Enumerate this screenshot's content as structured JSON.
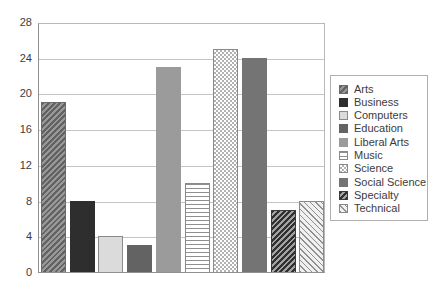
{
  "chart_data": {
    "type": "bar",
    "title": "",
    "xlabel": "",
    "ylabel": "",
    "categories": [
      "Arts",
      "Business",
      "Computers",
      "Education",
      "Liberal Arts",
      "Music",
      "Science",
      "Social Science",
      "Specialty",
      "Technical"
    ],
    "values": [
      19,
      8,
      4,
      3,
      23,
      10,
      25,
      24,
      7,
      8
    ],
    "ylim": [
      0,
      28
    ],
    "yticks": [
      0,
      4,
      8,
      12,
      16,
      20,
      24,
      28
    ],
    "grid": true,
    "legend_position": "right",
    "series_patterns": [
      {
        "name": "Arts",
        "pattern": "dark-diagonal-hatch",
        "colors": [
          "#626262",
          "#989898"
        ]
      },
      {
        "name": "Business",
        "pattern": "solid",
        "colors": [
          "#2e2e2e"
        ]
      },
      {
        "name": "Computers",
        "pattern": "solid",
        "colors": [
          "#dbdbdb"
        ]
      },
      {
        "name": "Education",
        "pattern": "solid",
        "colors": [
          "#636363"
        ]
      },
      {
        "name": "Liberal Arts",
        "pattern": "solid",
        "colors": [
          "#9b9b9b"
        ]
      },
      {
        "name": "Music",
        "pattern": "horizontal-lines",
        "colors": [
          "#8f8f8f",
          "#ffffff"
        ]
      },
      {
        "name": "Science",
        "pattern": "checkerboard",
        "colors": [
          "#b2b2b2",
          "#ffffff"
        ]
      },
      {
        "name": "Social Science",
        "pattern": "solid",
        "colors": [
          "#747474"
        ]
      },
      {
        "name": "Specialty",
        "pattern": "dense-dark-diagonal-hatch",
        "colors": [
          "#303030",
          "#a2a2a2"
        ]
      },
      {
        "name": "Technical",
        "pattern": "light-diagonal-hatch",
        "colors": [
          "#8f8f8f",
          "#f0f0f0"
        ]
      }
    ],
    "axis_text_color": "#3c3c3c",
    "gridline_color": "#c4c4c4",
    "frame_color": "#8f8f8f",
    "background_color": "#ffffff"
  }
}
